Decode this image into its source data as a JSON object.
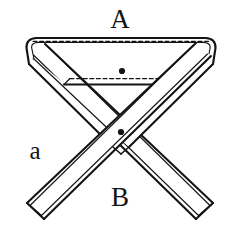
{
  "figure": {
    "background_color": "#ffffff",
    "ink_color": "#141414",
    "labels": {
      "top": "A",
      "bottom": "B",
      "left": "a"
    },
    "marker_dots": [
      {
        "name": "upper-dot",
        "x": 122,
        "y": 71,
        "r": 3.1
      },
      {
        "name": "lower-dot",
        "x": 121,
        "y": 132,
        "r": 3.1
      }
    ],
    "dashed_edges": [
      {
        "name": "upper-dashed-fold",
        "x1": 33,
        "y1": 41.5,
        "x2": 209,
        "y2": 41.5
      },
      {
        "name": "lower-dashed-fold",
        "x1": 70,
        "y1": 78.5,
        "x2": 175,
        "y2": 78.5
      }
    ],
    "strokes": {
      "outline_width": 2.1,
      "inner_width": 1.2,
      "dash_pattern": "4 2.6"
    }
  }
}
